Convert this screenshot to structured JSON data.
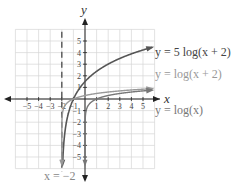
{
  "chart_data": {
    "type": "line",
    "title": "",
    "xlabel": "x",
    "ylabel": "y",
    "xlim": [
      -6,
      6
    ],
    "ylim": [
      -6,
      6
    ],
    "grid": true,
    "x_ticks": [
      -5,
      -4,
      -3,
      -2,
      -1,
      1,
      2,
      3,
      4,
      5
    ],
    "y_ticks": [
      -5,
      -4,
      -3,
      -2,
      -1,
      1,
      2,
      3,
      4,
      5
    ],
    "series": [
      {
        "name": "y = 5log(x + 2)",
        "color": "#555555",
        "expr": "5*log10(x+2)"
      },
      {
        "name": "y = log(x + 2)",
        "color": "#999999",
        "expr": "log10(x+2)"
      },
      {
        "name": "y = log(x)",
        "color": "#777777",
        "expr": "log10(x)"
      }
    ],
    "asymptote": {
      "label": "x = −2",
      "x": -2,
      "style": "dashed"
    },
    "labels": {
      "s1": "y = 5 log(x + 2)",
      "s2": "y = log(x + 2)",
      "s3": "y = log(x)",
      "asym": "x = −2",
      "x_axis": "x",
      "y_axis": "y"
    }
  }
}
